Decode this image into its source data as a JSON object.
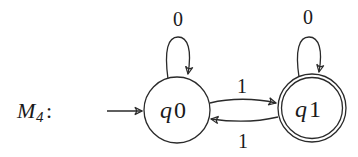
{
  "machine": {
    "name_main": "M",
    "name_sub": "4",
    "name_suffix": ":"
  },
  "states": [
    {
      "id": "q0",
      "label_main": "q",
      "label_num": "0",
      "start": true,
      "accept": false
    },
    {
      "id": "q1",
      "label_main": "q",
      "label_num": "1",
      "start": false,
      "accept": true
    }
  ],
  "transitions": [
    {
      "from": "q0",
      "to": "q0",
      "symbol": "0"
    },
    {
      "from": "q1",
      "to": "q1",
      "symbol": "0"
    },
    {
      "from": "q0",
      "to": "q1",
      "symbol": "1"
    },
    {
      "from": "q1",
      "to": "q0",
      "symbol": "1"
    }
  ],
  "colors": {
    "stroke": "#2a2a2a",
    "text": "#1a1a1a",
    "background": "#ffffff"
  }
}
